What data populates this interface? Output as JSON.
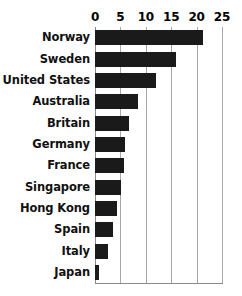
{
  "chart_data": {
    "type": "bar",
    "orientation": "horizontal",
    "title": "",
    "subtitle": "",
    "xlabel": "",
    "ylabel": "",
    "xlim": [
      0,
      25
    ],
    "ylim": null,
    "grid": true,
    "legend": null,
    "legend_position": "none",
    "xticks": [
      0,
      5,
      10,
      15,
      20,
      25
    ],
    "xtick_labels": [
      "0",
      "5",
      "10",
      "15",
      "20",
      "25"
    ],
    "categories": [
      "Norway",
      "Sweden",
      "United States",
      "Australia",
      "Britain",
      "Germany",
      "France",
      "Singapore",
      "Hong Kong",
      "Spain",
      "Italy",
      "Japan"
    ],
    "values": [
      21.3,
      16.0,
      12.0,
      8.5,
      6.7,
      5.9,
      5.7,
      5.1,
      4.3,
      3.6,
      2.5,
      0.8
    ],
    "annotations": []
  },
  "style": {
    "bar_color": "#1a1a1a",
    "grid_color": "#a8a8a8",
    "axis_color": "#8a8a8a",
    "background_color": "#ffffff",
    "label_color": "#111111"
  }
}
